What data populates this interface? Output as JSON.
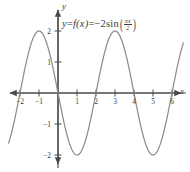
{
  "figure": {
    "equation": {
      "lhs_y": "y",
      "eq1": "=",
      "fx": "f(x)",
      "eq2": "=",
      "rhs_coef": "−2",
      "rhs_fn": "sin",
      "arg_num": "πx",
      "arg_den": "2",
      "plain": "y = f(x) = −2sin(πx/2)"
    },
    "axis_labels": {
      "x": "x",
      "y": "y"
    },
    "colors": {
      "curve": "#8c8c8c",
      "axis": "#4a4a4a",
      "text": "#3a3a3a",
      "background": "#ffffff"
    }
  },
  "chart_data": {
    "type": "line",
    "xlabel": "x",
    "ylabel": "y",
    "xlim": [
      -2.6,
      6.6
    ],
    "ylim": [
      -2.5,
      2.5
    ],
    "grid": false,
    "legend": null,
    "function": "-2*sin(pi*x/2)",
    "amplitude": 2,
    "period": 4,
    "xticks": [
      -2,
      -1,
      1,
      2,
      3,
      4,
      5,
      6
    ],
    "xtick_labels": [
      "−2",
      "−1",
      "1",
      "2",
      "3",
      "4",
      "5",
      "6"
    ],
    "yticks": [
      2,
      1,
      -1,
      -2
    ],
    "ytick_labels": [
      "2",
      "1",
      "−1",
      "−2"
    ],
    "zeros": [
      -2,
      0,
      2,
      4,
      6
    ],
    "maxima": [
      {
        "x": -1,
        "y": 2
      },
      {
        "x": 3,
        "y": 2
      }
    ],
    "minima": [
      {
        "x": 1,
        "y": -2
      },
      {
        "x": 5,
        "y": -2
      }
    ],
    "series": [
      {
        "name": "f(x) = -2sin(πx/2)",
        "x": [
          -2.6,
          -2.4,
          -2.2,
          -2.0,
          -1.8,
          -1.6,
          -1.4,
          -1.2,
          -1.0,
          -0.8,
          -0.6,
          -0.4,
          -0.2,
          0.0,
          0.2,
          0.4,
          0.6,
          0.8,
          1.0,
          1.2,
          1.4,
          1.6,
          1.8,
          2.0,
          2.2,
          2.4,
          2.6,
          2.8,
          3.0,
          3.2,
          3.4,
          3.6,
          3.8,
          4.0,
          4.2,
          4.4,
          4.6,
          4.8,
          5.0,
          5.2,
          5.4,
          5.6,
          5.8,
          6.0,
          6.2,
          6.4
        ],
        "y": [
          1.176,
          1.902,
          1.902,
          0.0,
          0.618,
          1.176,
          1.618,
          1.902,
          2.0,
          1.902,
          1.618,
          1.176,
          0.618,
          0.0,
          -0.618,
          -1.176,
          -1.618,
          -1.902,
          -2.0,
          -1.902,
          -1.618,
          -1.176,
          -0.618,
          0.0,
          0.618,
          1.176,
          1.618,
          1.902,
          2.0,
          1.902,
          1.618,
          1.176,
          0.618,
          0.0,
          -0.618,
          -1.176,
          -1.618,
          -1.902,
          -2.0,
          -1.902,
          -1.618,
          -1.176,
          -0.618,
          0.0,
          0.618,
          1.176
        ]
      }
    ]
  }
}
